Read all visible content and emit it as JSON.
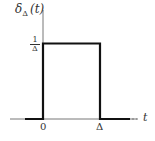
{
  "diagram": {
    "type": "rectangular-pulse",
    "y_label": {
      "symbol": "δ",
      "subscript": "Δ",
      "arg": "(t)"
    },
    "x_label": "t",
    "height_label": {
      "numerator": "1",
      "denominator": "Δ"
    },
    "x_ticks": [
      "0",
      "Δ"
    ],
    "pulse": {
      "start": "0",
      "end": "Δ",
      "height": "1/Δ"
    },
    "colors": {
      "line": "#111111",
      "axis": "#555555"
    }
  }
}
